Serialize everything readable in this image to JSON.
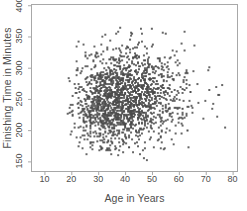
{
  "chart_data": {
    "type": "scatter",
    "title": "",
    "xlabel": "Age in Years",
    "ylabel": "Finishing Time in Minutes",
    "xlim": [
      5,
      82
    ],
    "ylim": [
      133,
      402
    ],
    "xticks": [
      10,
      20,
      30,
      40,
      50,
      60,
      70,
      80
    ],
    "ytickvals": [
      150,
      200,
      250,
      300,
      350,
      400
    ],
    "xticklabels": [
      "10",
      "20",
      "30",
      "40",
      "50",
      "60",
      "70",
      "80"
    ],
    "yticklabels": [
      "150",
      "200",
      "250",
      "300",
      "350",
      "400"
    ],
    "grid": false,
    "legend": null,
    "n_points": 1720,
    "marker": {
      "shape": "square",
      "size_px": 2,
      "color": "#4a4a4a",
      "opacity": 0.85
    },
    "frame_color": "#a8a8a8",
    "background": "#ffffff",
    "distribution": {
      "description": "Marathon finishers: age vs finishing time. Weak positive association.",
      "age_mean": 40.5,
      "age_sd": 10.2,
      "age_min": 18,
      "age_max": 78,
      "time_mean": 252,
      "time_sd": 40,
      "time_min": 142,
      "time_max": 365,
      "correlation": 0.11,
      "seed": 20240517
    },
    "observed_ranges": {
      "age_observed": [
        18,
        77
      ],
      "time_observed": [
        142,
        363
      ]
    }
  }
}
